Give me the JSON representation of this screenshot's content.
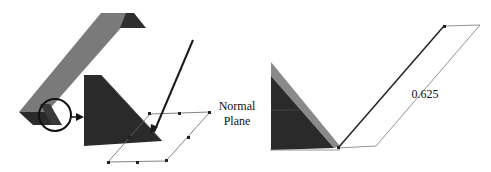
{
  "labels": {
    "normal_plane_line1": "Normal",
    "normal_plane_line2": "Plane",
    "dimension_value": "0.625"
  },
  "colors": {
    "background": "#ffffff",
    "angle_top_face": "#7a7a7a",
    "angle_dark_face": "#2b2b2b",
    "gusset_dark": "#2a2a2a",
    "gusset_edge": "#8a8a8a",
    "plane_outline": "#555555",
    "arrow": "#1a1a1a"
  }
}
